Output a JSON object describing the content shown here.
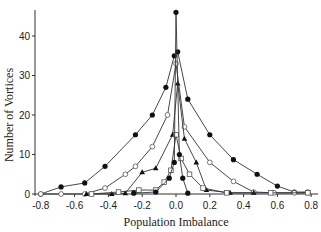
{
  "chart_data": {
    "type": "line",
    "title": "",
    "xlabel": "Population Imbalance",
    "ylabel": "Number of Vortices",
    "xlim": [
      -0.8,
      0.8
    ],
    "ylim": [
      0,
      46
    ],
    "xticks": [
      -0.8,
      -0.6,
      -0.4,
      -0.2,
      0.0,
      0.2,
      0.4,
      0.6,
      0.8
    ],
    "xtick_labels": [
      "-0.8",
      "-0.6",
      "-0.4",
      "-0.2",
      "0.0",
      "0.2",
      "0.4",
      "0.6",
      "0.8"
    ],
    "yticks": [
      0,
      10,
      20,
      30,
      40
    ],
    "ytick_labels": [
      "0",
      "10",
      "20",
      "30",
      "40"
    ],
    "grid": false,
    "legend": null,
    "series": [
      {
        "name": "series-1",
        "marker": "filled-circle",
        "x": [
          -0.8,
          -0.68,
          -0.54,
          -0.42,
          -0.24,
          -0.14,
          -0.06,
          -0.01,
          0.01,
          0.07,
          0.2,
          0.34,
          0.48,
          0.6,
          0.7,
          0.78
        ],
        "y": [
          0,
          1.8,
          2.8,
          7,
          15,
          20,
          27,
          35,
          36,
          24,
          15,
          8.7,
          5,
          2,
          0.5,
          0.5
        ]
      },
      {
        "name": "series-2",
        "marker": "open-circle",
        "x": [
          -0.8,
          -0.68,
          -0.54,
          -0.42,
          -0.3,
          -0.24,
          -0.14,
          -0.05,
          0.0,
          0.05,
          0.2,
          0.34,
          0.46,
          0.58,
          0.7,
          0.78
        ],
        "y": [
          0,
          0,
          0,
          1.5,
          5,
          7,
          12,
          20,
          33,
          17,
          8,
          3.2,
          0.5,
          0.3,
          0.3,
          0.3
        ]
      },
      {
        "name": "series-3",
        "marker": "filled-triangle",
        "x": [
          -0.53,
          -0.38,
          -0.3,
          -0.2,
          -0.12,
          -0.02,
          0.01,
          0.05,
          0.12,
          0.18,
          0.32,
          0.46
        ],
        "y": [
          0,
          0,
          0.2,
          5.5,
          6.5,
          15,
          28,
          14,
          8,
          1,
          0.3,
          0.3
        ]
      },
      {
        "name": "series-4",
        "marker": "open-square",
        "x": [
          -0.5,
          -0.34,
          -0.22,
          -0.12,
          -0.07,
          -0.03,
          0.0,
          0.03,
          0.08,
          0.16,
          0.3,
          0.56,
          0.78
        ],
        "y": [
          0,
          0.5,
          1,
          1,
          3,
          6,
          15,
          9,
          5,
          1.5,
          0.3,
          0.3,
          0.3
        ]
      },
      {
        "name": "series-5",
        "marker": "filled-circle",
        "x": [
          -0.25,
          -0.12,
          -0.04,
          -0.01,
          0.0,
          0.02,
          0.04,
          0.07
        ],
        "y": [
          0.2,
          0.5,
          4,
          8,
          46,
          10,
          4,
          0.2
        ]
      }
    ]
  }
}
